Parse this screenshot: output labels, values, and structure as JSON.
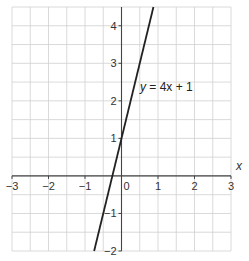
{
  "chart_data": {
    "type": "line",
    "title": "",
    "xlabel": "x",
    "ylabel": "y",
    "xlim": [
      -3,
      3
    ],
    "ylim": [
      -2,
      4.5
    ],
    "grid": true,
    "grid_step": 0.5,
    "x_ticks": [
      -3,
      -2,
      -1,
      0,
      1,
      2,
      3
    ],
    "x_tick_labels": [
      "−3",
      "−2",
      "−1",
      "0",
      "1",
      "2",
      "3"
    ],
    "y_ticks": [
      -2,
      -1,
      1,
      2,
      3,
      4
    ],
    "y_tick_labels": [
      "−2",
      "−1",
      "1",
      "2",
      "3",
      "4"
    ],
    "series": [
      {
        "name": "y = 4x + 1",
        "equation": "y = 4x + 1",
        "slope": 4,
        "intercept": 1,
        "x": [
          -0.75,
          0.875
        ],
        "y": [
          -2,
          4.5
        ]
      }
    ],
    "annotations": [
      {
        "text": "y = 4x + 1",
        "x": 0.5,
        "y": 2
      }
    ],
    "colors": {
      "line": "#222222",
      "grid": "#d0d0d0",
      "axis": "#444444"
    }
  },
  "labels": {
    "x_axis": "x",
    "origin": "0",
    "equation_y": "y",
    "equation_rest": " = 4x + 1"
  }
}
